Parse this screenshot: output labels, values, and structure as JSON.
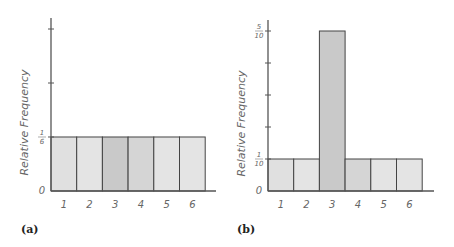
{
  "chart_data": [
    {
      "type": "bar",
      "panel_label": "(a)",
      "title": "",
      "xlabel": "",
      "ylabel": "Relative Frequency",
      "categories": [
        "1",
        "2",
        "3",
        "4",
        "5",
        "6"
      ],
      "values": [
        0.1667,
        0.1667,
        0.1667,
        0.1667,
        0.1667,
        0.1667
      ],
      "value_labels": [
        "1/6",
        "1/6",
        "1/6",
        "1/6",
        "1/6",
        "1/6"
      ],
      "y_tick_labels": [
        {
          "value": 0,
          "label": "0"
        },
        {
          "value": 0.1667,
          "label": "1/6"
        }
      ],
      "y_unlabeled_ticks": [
        0.3333,
        0.5
      ],
      "ylim": [
        0,
        0.52
      ],
      "grid": false,
      "legend": null,
      "bar_colors": [
        "#e0e0e0",
        "#e4e4e4",
        "#c9c9c9",
        "#d5d5d5",
        "#e4e4e4",
        "#e4e4e4"
      ]
    },
    {
      "type": "bar",
      "panel_label": "(b)",
      "title": "",
      "xlabel": "",
      "ylabel": "Relative Frequency",
      "categories": [
        "1",
        "2",
        "3",
        "4",
        "5",
        "6"
      ],
      "values": [
        0.1,
        0.1,
        0.5,
        0.1,
        0.1,
        0.1
      ],
      "value_labels": [
        "1/10",
        "1/10",
        "5/10",
        "1/10",
        "1/10",
        "1/10"
      ],
      "y_tick_labels": [
        {
          "value": 0,
          "label": "0"
        },
        {
          "value": 0.1,
          "label": "1/10"
        },
        {
          "value": 0.5,
          "label": "5/10"
        }
      ],
      "y_unlabeled_ticks": [
        0.2,
        0.3,
        0.4
      ],
      "ylim": [
        0,
        0.53
      ],
      "grid": false,
      "legend": null,
      "bar_colors": [
        "#e0e0e0",
        "#e4e4e4",
        "#c9c9c9",
        "#d5d5d5",
        "#e4e4e4",
        "#e4e4e4"
      ]
    }
  ],
  "panels": {
    "a": {
      "label": "(a)",
      "ylabel": "Relative Frequency",
      "tick_zero": "0",
      "tick_top_num": "1",
      "tick_top_den": "6"
    },
    "b": {
      "label": "(b)",
      "ylabel": "Relative Frequency",
      "tick_zero": "0",
      "tick_low_num": "1",
      "tick_low_den": "10",
      "tick_top_num": "5",
      "tick_top_den": "10"
    }
  }
}
